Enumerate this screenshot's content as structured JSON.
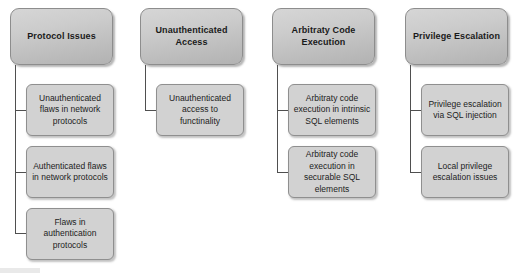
{
  "diagram": {
    "type": "tree-hierarchy",
    "orientation": "top-down",
    "background_color": "#ffffff",
    "header_fill_color": "#cccccc",
    "child_fill_color": "#d2d2d2",
    "border_color": "#8d8d8d",
    "connector_color": "#4f4f4f",
    "columns": [
      {
        "id": "protocol-issues",
        "header": "Protocol Issues",
        "children": [
          "Unauthenticated flaws in network protocols",
          "Authenticated flaws in network protocols",
          "Flaws in authentication protocols"
        ]
      },
      {
        "id": "unauthenticated-access",
        "header": "Unauthenticated Access",
        "children": [
          "Unauthenticated access to functinality"
        ]
      },
      {
        "id": "arbitrary-code-execution",
        "header": "Arbitraty Code Execution",
        "children": [
          "Arbitraty code execution in intrinsic SQL elements",
          "Arbitraty code execution in securable SQL elements"
        ]
      },
      {
        "id": "privilege-escalation",
        "header": "Privilege Escalation",
        "children": [
          "Privilege escalation via SQL injection",
          "Local privilege escalation issues"
        ]
      }
    ]
  }
}
